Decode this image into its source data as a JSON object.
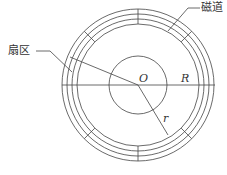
{
  "diagram": {
    "title": "",
    "labels": {
      "track": "磁道",
      "sector": "扇区",
      "center": "O",
      "outer_radius": "R",
      "inner_radius": "r"
    },
    "geometry": {
      "center": [
        138,
        85
      ],
      "track_radii": [
        76,
        71,
        66,
        61
      ],
      "inner_circle_radius": 29,
      "sector_divider_angles_deg": [
        -90,
        -45,
        45,
        90,
        135,
        -135
      ]
    },
    "colors": {
      "line": "#444444",
      "text": "#333333",
      "background": "#ffffff"
    }
  }
}
